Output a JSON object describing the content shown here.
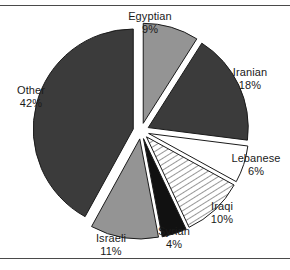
{
  "chart_data": {
    "type": "pie",
    "title": "",
    "subtitle": "",
    "xlabel": "",
    "ylabel": "",
    "legend_position": "none",
    "grid": false,
    "exploded": true,
    "units": "percent",
    "categories": [
      "Egyptian",
      "Iranian",
      "Lebanese",
      "Iraqi",
      "Syrian",
      "Israeli",
      "Other"
    ],
    "values": [
      9,
      18,
      6,
      10,
      4,
      11,
      42
    ],
    "slices": [
      {
        "label": "Egyptian",
        "value": 9,
        "pct_text": "9%",
        "fill": "#949494",
        "pattern": "solid",
        "stroke": "#1a1a1a"
      },
      {
        "label": "Iranian",
        "value": 18,
        "pct_text": "18%",
        "fill": "#3b3b3b",
        "pattern": "solid",
        "stroke": "#1a1a1a"
      },
      {
        "label": "Lebanese",
        "value": 6,
        "pct_text": "6%",
        "fill": "#ffffff",
        "pattern": "solid",
        "stroke": "#1a1a1a"
      },
      {
        "label": "Iraqi",
        "value": 10,
        "pct_text": "10%",
        "fill": "#ffffff",
        "pattern": "diagonal-hatch",
        "stroke": "#1a1a1a"
      },
      {
        "label": "Syrian",
        "value": 4,
        "pct_text": "4%",
        "fill": "#111111",
        "pattern": "solid",
        "stroke": "#1a1a1a"
      },
      {
        "label": "Israeli",
        "value": 11,
        "pct_text": "11%",
        "fill": "#949494",
        "pattern": "solid",
        "stroke": "#1a1a1a"
      },
      {
        "label": "Other",
        "value": 42,
        "pct_text": "42%",
        "fill": "#3b3b3b",
        "pattern": "solid",
        "stroke": "#1a1a1a"
      }
    ]
  },
  "figure": {
    "background": "#ffffff",
    "rule_color": "#4a4a4a",
    "text_color": "#1a1a1a"
  }
}
